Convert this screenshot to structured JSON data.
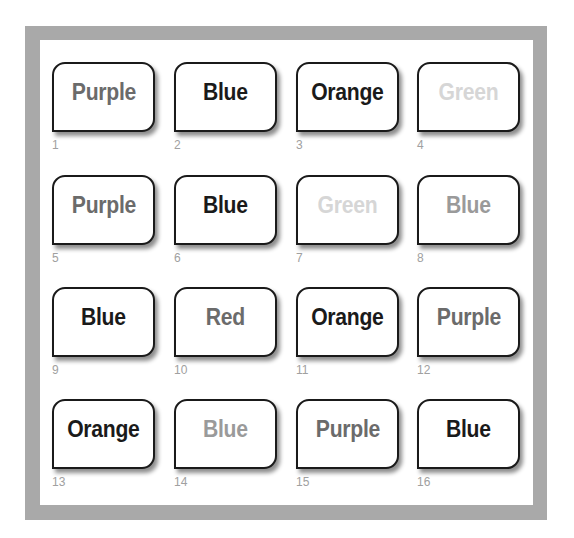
{
  "colors": {
    "frame": "#a9a9a9",
    "panel": "#ffffff",
    "card_border": "#1a1a1a",
    "number_text": "#a0a0a0"
  },
  "shades": {
    "black": "#1a1a1a",
    "dark_gray": "#6b6b6b",
    "mid_gray": "#9a9a9a",
    "light_gray": "#d6d6d6"
  },
  "cards": [
    {
      "number": "1",
      "word": "Purple",
      "shade": "dark_gray"
    },
    {
      "number": "2",
      "word": "Blue",
      "shade": "black"
    },
    {
      "number": "3",
      "word": "Orange",
      "shade": "black"
    },
    {
      "number": "4",
      "word": "Green",
      "shade": "light_gray"
    },
    {
      "number": "5",
      "word": "Purple",
      "shade": "dark_gray"
    },
    {
      "number": "6",
      "word": "Blue",
      "shade": "black"
    },
    {
      "number": "7",
      "word": "Green",
      "shade": "light_gray"
    },
    {
      "number": "8",
      "word": "Blue",
      "shade": "mid_gray"
    },
    {
      "number": "9",
      "word": "Blue",
      "shade": "black"
    },
    {
      "number": "10",
      "word": "Red",
      "shade": "dark_gray"
    },
    {
      "number": "11",
      "word": "Orange",
      "shade": "black"
    },
    {
      "number": "12",
      "word": "Purple",
      "shade": "dark_gray"
    },
    {
      "number": "13",
      "word": "Orange",
      "shade": "black"
    },
    {
      "number": "14",
      "word": "Blue",
      "shade": "mid_gray"
    },
    {
      "number": "15",
      "word": "Purple",
      "shade": "dark_gray"
    },
    {
      "number": "16",
      "word": "Blue",
      "shade": "black"
    }
  ]
}
